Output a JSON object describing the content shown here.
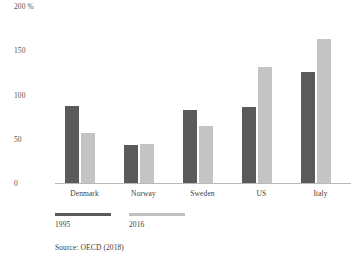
{
  "chart_data": {
    "type": "bar",
    "title": "",
    "subtitle": "",
    "xlabel": "",
    "ylabel": "",
    "y_unit_label": "200 %",
    "categories": [
      "Denmark",
      "Norway",
      "Sweden",
      "US",
      "Italy"
    ],
    "series": [
      {
        "name": "1995",
        "color": "#5a5a5a",
        "values": [
          87,
          43,
          82,
          86,
          125
        ]
      },
      {
        "name": "2016",
        "color": "#c4c4c4",
        "values": [
          56,
          44,
          64,
          131,
          163
        ]
      }
    ],
    "ylim": [
      0,
      200
    ],
    "yticks": [
      0,
      50,
      100,
      150,
      200
    ],
    "ytick_labels": [
      "0",
      "50",
      "100",
      "150",
      "200 %"
    ],
    "grid": false,
    "legend_position": "bottom-left",
    "annotations": [
      "Source: OECD (2018)"
    ]
  },
  "axis": {
    "y_labels": [
      "200 %",
      "150",
      "100",
      "50",
      "0"
    ]
  },
  "legend": {
    "entries": [
      {
        "label": "1995"
      },
      {
        "label": "2016"
      }
    ]
  },
  "footer": {
    "source": "Source: OECD (2018)"
  },
  "colors": {
    "series_1995": "#5a5a5a",
    "series_2016": "#c4c4c4",
    "axis_line": "#b9b9b9",
    "text": "#3f3c3a",
    "background": "#ffffff"
  }
}
